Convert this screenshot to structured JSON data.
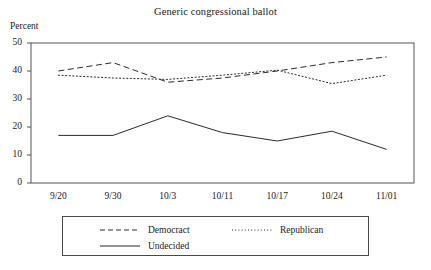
{
  "chart_data": {
    "type": "line",
    "title": "Generic congressional ballot",
    "xlabel": "",
    "ylabel": "Percent",
    "ylim": [
      0,
      50
    ],
    "yticks": [
      0,
      10,
      20,
      30,
      40,
      50
    ],
    "grid": false,
    "legend_position": "below-plot",
    "categories": [
      "9/20",
      "9/30",
      "10/3",
      "10/11",
      "10/17",
      "10/24",
      "11/01"
    ],
    "series": [
      {
        "name": "Democract",
        "style": "dashed",
        "color": "#2b2b2b",
        "values": [
          40,
          43,
          36,
          37.5,
          40,
          43,
          45
        ]
      },
      {
        "name": "Republican",
        "style": "dotted",
        "color": "#2b2b2b",
        "values": [
          38.5,
          37.5,
          37,
          38.5,
          40.3,
          35.5,
          38.5
        ]
      },
      {
        "name": "Undecided",
        "style": "solid",
        "color": "#2b2b2b",
        "values": [
          17,
          17,
          24,
          18,
          15,
          18.5,
          12
        ]
      }
    ]
  },
  "axis": {
    "y_label": "Percent",
    "y_ticks": [
      "50",
      "40",
      "30",
      "20",
      "10",
      "0"
    ],
    "x_ticks": [
      "9/20",
      "9/30",
      "10/3",
      "10/11",
      "10/17",
      "10/24",
      "11/01"
    ]
  },
  "legend": {
    "democrat_label": "Democract",
    "republican_label": "Republican",
    "undecided_label": "Undecided"
  },
  "colors": {
    "line": "#2b2b2b",
    "frame": "#555555",
    "text": "#1a1a1a"
  }
}
